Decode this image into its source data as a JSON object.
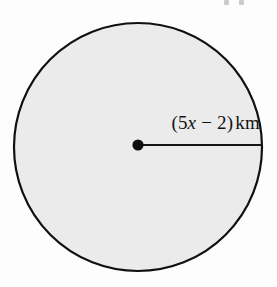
{
  "figure": {
    "type": "circle-diagram",
    "background_color": "#fdfdfd",
    "shape": {
      "name": "circle",
      "fill_color": "#ebebeb",
      "stroke_color": "#101010",
      "stroke_width": 2,
      "center_x": 138,
      "center_y": 147,
      "radius_x": 125,
      "radius_y": 125
    },
    "center_point": {
      "name": "center-dot",
      "color": "#0d0d0d",
      "radius": 6,
      "x": 138,
      "y": 145
    },
    "radius_segment": {
      "name": "radius-line",
      "color": "#151515",
      "stroke_width": 2,
      "x1": 138,
      "y1": 145,
      "x2": 262,
      "y2": 145
    },
    "radius_label": {
      "full_text": "(5x − 2) km",
      "open_paren": "(",
      "coefficient": "5",
      "variable": "x",
      "operator": "−",
      "constant": "2",
      "close_paren": ")",
      "unit": "km",
      "color": "#131313"
    }
  }
}
